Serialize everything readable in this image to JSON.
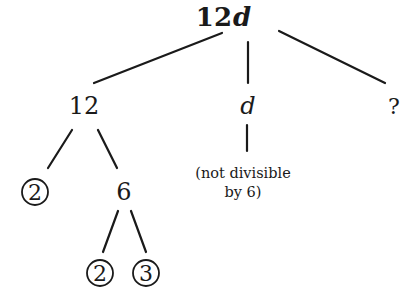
{
  "diagram": {
    "type": "factor-tree",
    "root": {
      "label_num": "12",
      "label_var": "d"
    },
    "children": [
      {
        "label": "12",
        "italic": false
      },
      {
        "label": "d",
        "italic": true
      },
      {
        "label": "?",
        "italic": false
      }
    ],
    "factors_of_12": [
      {
        "label": "2",
        "circled": true
      },
      {
        "label": "6",
        "circled": false
      }
    ],
    "factors_of_6": [
      {
        "label": "2",
        "circled": true
      },
      {
        "label": "3",
        "circled": true
      }
    ],
    "d_note": {
      "line1": "(not divisible",
      "line2": "by 6)"
    }
  },
  "colors": {
    "ink": "#1a1a1a",
    "background": "#ffffff"
  }
}
